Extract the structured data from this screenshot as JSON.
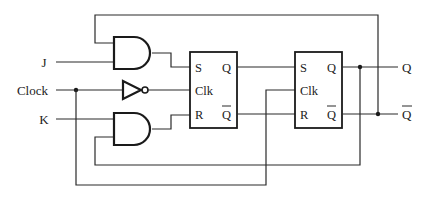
{
  "diagram": {
    "type": "JK master-slave flip-flop circuit",
    "inputs": {
      "j": "J",
      "clock": "Clock",
      "k": "K"
    },
    "outputs": {
      "q": "Q",
      "q_bar": "Q"
    },
    "flipflop_1": {
      "s": "S",
      "clk": "Clk",
      "r": "R",
      "q": "Q",
      "q_bar": "Q"
    },
    "flipflop_2": {
      "s": "S",
      "clk": "Clk",
      "r": "R",
      "q": "Q",
      "q_bar": "Q"
    },
    "gates": [
      "AND (J)",
      "NOT (Clock)",
      "AND (K)"
    ]
  }
}
